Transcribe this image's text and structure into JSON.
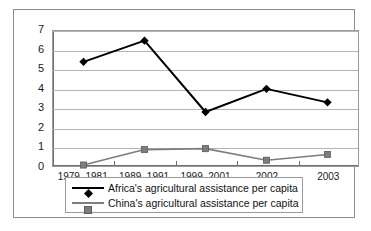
{
  "chart_data": {
    "type": "line",
    "title": "",
    "subtitle": "",
    "xlabel": "",
    "ylabel": "",
    "categories": [
      "1979–1981",
      "1989–1991",
      "1999–2001",
      "2002",
      "2003"
    ],
    "series": [
      {
        "name": "Africa's agricultural assistance per capita",
        "values": [
          5.4,
          6.5,
          2.8,
          4.0,
          3.3
        ],
        "color": "#000000",
        "marker": "diamond"
      },
      {
        "name": "China's agricultural assistance per capita",
        "values": [
          0.05,
          0.85,
          0.9,
          0.3,
          0.6
        ],
        "color": "#7d7d7d",
        "marker": "square"
      }
    ],
    "ylim": [
      0,
      7
    ],
    "yticks": [
      "0",
      "1",
      "2",
      "3",
      "4",
      "5",
      "6",
      "7"
    ],
    "grid": true,
    "grid_axis": "y",
    "legend_position": "bottom",
    "legend": [
      "Africa's agricultural assistance per capita",
      "China's agricultural assistance per capita"
    ]
  },
  "colors": {
    "africa_series": "#000000",
    "china_series": "#7d7d7d",
    "gridline": "#b4b4b4",
    "axis": "#6f6f6f",
    "frame": "#8d8d8d",
    "background": "#ffffff",
    "text": "#1a1a1a"
  }
}
